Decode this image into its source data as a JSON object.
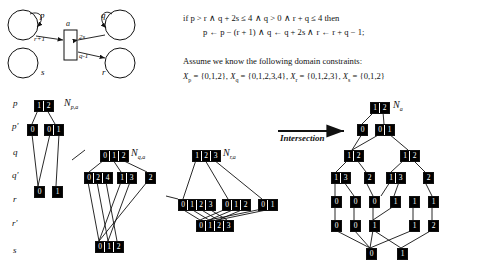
{
  "figure": {
    "arrow_label": "Intersection"
  },
  "transition_diagram": {
    "nodes": [
      {
        "id": "p",
        "label": "p",
        "cx": 22,
        "cy": 24,
        "r": 15
      },
      {
        "id": "q",
        "label": "q",
        "cx": 120,
        "cy": 24,
        "r": 15
      },
      {
        "id": "s",
        "label": "s",
        "cx": 22,
        "cy": 62,
        "r": 15
      },
      {
        "id": "r",
        "label": "r",
        "cx": 120,
        "cy": 62,
        "r": 15
      }
    ],
    "action_box": {
      "label": "a",
      "x": 62,
      "y": 30,
      "w": 12,
      "h": 30
    },
    "edge_labels": [
      {
        "text": "r+1",
        "x": 38,
        "y": 41
      },
      {
        "text": "2s",
        "x": 78,
        "y": 41
      },
      {
        "text": "q-1",
        "x": 78,
        "y": 57
      }
    ]
  },
  "rule": {
    "line1": "if p > r  ∧  q + 2s ≤ 4  ∧  q > 0  ∧  r + q ≤ 4 then",
    "line2": "p ← p − (r + 1)  ∧  q ← q + 2s  ∧  r ← r + q − 1;"
  },
  "domains": {
    "intro": "Assume we know the following domain constraints:",
    "items": [
      {
        "var": "p",
        "set": "{0,1,2}"
      },
      {
        "var": "q",
        "set": "{0,1,2,3,4}"
      },
      {
        "var": "r",
        "set": "{0,1,2,3}"
      },
      {
        "var": "s",
        "set": "{0,1,2}"
      }
    ]
  },
  "row_labels": [
    "p",
    "p'",
    "q",
    "q'",
    "r",
    "r'",
    "s"
  ],
  "mdd_names": {
    "p": "N",
    "p_sub": "p,a",
    "q": "N",
    "q_sub": "q,a",
    "r": "N",
    "r_sub": "r,a",
    "result": "N",
    "result_sub": "a"
  },
  "mdd_p": {
    "name": "N_{p,a}",
    "nodes": [
      {
        "id": "p1",
        "row": "p",
        "x": 34,
        "y": 100,
        "values": [
          "1",
          "2"
        ]
      },
      {
        "id": "p2",
        "row": "p'",
        "x": 27,
        "y": 124,
        "values": [
          "0"
        ]
      },
      {
        "id": "p3",
        "row": "p'",
        "x": 44,
        "y": 124,
        "values": [
          "0",
          "1"
        ]
      },
      {
        "id": "p4",
        "row": "r",
        "x": 34,
        "y": 186,
        "values": [
          "0"
        ]
      },
      {
        "id": "p5",
        "row": "r",
        "x": 52,
        "y": 186,
        "values": [
          "1"
        ]
      }
    ]
  },
  "mdd_q": {
    "name": "N_{q,a}",
    "nodes": [
      {
        "id": "q1",
        "row": "q",
        "x": 100,
        "y": 150,
        "values": [
          "0",
          "1",
          "2"
        ]
      },
      {
        "id": "q2",
        "row": "q'",
        "x": 84,
        "y": 172,
        "values": [
          "0",
          "2",
          "4"
        ]
      },
      {
        "id": "q3",
        "row": "q'",
        "x": 117,
        "y": 172,
        "values": [
          "1",
          "3"
        ]
      },
      {
        "id": "q4",
        "row": "q'",
        "x": 145,
        "y": 172,
        "values": [
          "2"
        ]
      },
      {
        "id": "q5",
        "row": "s",
        "x": 95,
        "y": 241,
        "values": [
          "0",
          "1",
          "2"
        ]
      }
    ]
  },
  "mdd_r": {
    "name": "N_{r,a}",
    "nodes": [
      {
        "id": "r1",
        "row": "q",
        "x": 192,
        "y": 150,
        "values": [
          "1",
          "2",
          "3"
        ]
      },
      {
        "id": "r2",
        "row": "r",
        "x": 178,
        "y": 199,
        "values": [
          "0",
          "1",
          "2",
          "3"
        ]
      },
      {
        "id": "r3",
        "row": "r",
        "x": 222,
        "y": 199,
        "values": [
          "0",
          "1",
          "2"
        ]
      },
      {
        "id": "r4",
        "row": "r",
        "x": 258,
        "y": 199,
        "values": [
          "0",
          "1"
        ]
      },
      {
        "id": "r5",
        "row": "r'",
        "x": 196,
        "y": 220,
        "values": [
          "0",
          "1",
          "2",
          "3"
        ]
      }
    ]
  },
  "mdd_result": {
    "name": "N_a",
    "nodes": [
      {
        "id": "a1",
        "row": "p",
        "x": 370,
        "y": 102,
        "values": [
          "1",
          "2"
        ]
      },
      {
        "id": "a2",
        "row": "p'",
        "x": 357,
        "y": 124,
        "values": [
          "0"
        ]
      },
      {
        "id": "a3",
        "row": "p'",
        "x": 375,
        "y": 124,
        "values": [
          "0",
          "1"
        ]
      },
      {
        "id": "a4",
        "row": "q",
        "x": 344,
        "y": 150,
        "values": [
          "1",
          "2"
        ]
      },
      {
        "id": "a5",
        "row": "q",
        "x": 400,
        "y": 150,
        "values": [
          "1",
          "2"
        ]
      },
      {
        "id": "a6",
        "row": "q'",
        "x": 331,
        "y": 172,
        "values": [
          "1",
          "3"
        ]
      },
      {
        "id": "a7",
        "row": "q'",
        "x": 364,
        "y": 172,
        "values": [
          "2"
        ]
      },
      {
        "id": "a8",
        "row": "q'",
        "x": 386,
        "y": 172,
        "values": [
          "1",
          "3"
        ]
      },
      {
        "id": "a9",
        "row": "q'",
        "x": 423,
        "y": 172,
        "values": [
          "2"
        ]
      },
      {
        "id": "a10",
        "row": "r",
        "x": 331,
        "y": 196,
        "values": [
          "0"
        ]
      },
      {
        "id": "a11",
        "row": "r",
        "x": 350,
        "y": 196,
        "values": [
          "0"
        ]
      },
      {
        "id": "a12",
        "row": "r",
        "x": 369,
        "y": 196,
        "values": [
          "0"
        ]
      },
      {
        "id": "a13",
        "row": "r",
        "x": 390,
        "y": 196,
        "values": [
          "1"
        ]
      },
      {
        "id": "a14",
        "row": "r",
        "x": 409,
        "y": 196,
        "values": [
          "1"
        ]
      },
      {
        "id": "a15",
        "row": "r",
        "x": 428,
        "y": 196,
        "values": [
          "1"
        ]
      },
      {
        "id": "a16",
        "row": "r'",
        "x": 331,
        "y": 220,
        "values": [
          "0"
        ]
      },
      {
        "id": "a17",
        "row": "r'",
        "x": 350,
        "y": 220,
        "values": [
          "0"
        ]
      },
      {
        "id": "a18",
        "row": "r'",
        "x": 369,
        "y": 220,
        "values": [
          "1"
        ]
      },
      {
        "id": "a19",
        "row": "r'",
        "x": 409,
        "y": 220,
        "values": [
          "1"
        ]
      },
      {
        "id": "a20",
        "row": "r'",
        "x": 428,
        "y": 220,
        "values": [
          "2"
        ]
      },
      {
        "id": "a21",
        "row": "s",
        "x": 366,
        "y": 248,
        "values": [
          "0"
        ]
      },
      {
        "id": "a22",
        "row": "s",
        "x": 397,
        "y": 248,
        "values": [
          "1"
        ]
      }
    ]
  }
}
